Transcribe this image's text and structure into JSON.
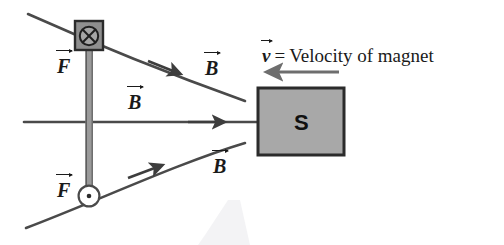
{
  "figure": {
    "background_color": "#ffffff",
    "line_color": "#4a4a4a",
    "dark_line_color": "#3a3a3a",
    "magnet": {
      "pole_label": "S",
      "fill_color": "#a8a8a8",
      "border_color": "#2b2b2b"
    },
    "velocity": {
      "symbol": "v",
      "equals": "=",
      "text": "Velocity of magnet",
      "full_label": "v = Velocity of magnet",
      "arrow_direction": "left",
      "arrow_color": "#6e6e6e"
    },
    "field_labels": [
      {
        "symbol": "B",
        "position": "upper-right-curve"
      },
      {
        "symbol": "B",
        "position": "middle-straight-line"
      },
      {
        "symbol": "B",
        "position": "lower-right-curve"
      }
    ],
    "force_labels": [
      {
        "symbol": "F",
        "position": "upper-rod"
      },
      {
        "symbol": "F",
        "position": "lower-rod"
      }
    ],
    "current_markers": [
      {
        "name": "into-page",
        "glyph": "cross-in-circle",
        "shape": "square",
        "fill_color": "#8f8f8f",
        "border_color": "#2b2b2b"
      },
      {
        "name": "out-of-page",
        "glyph": "dot-in-circle",
        "shape": "circle",
        "fill_color": "#ffffff",
        "border_color": "#4a4a4a"
      }
    ],
    "rod": {
      "fill_color": "#9a9a9a",
      "edge_color": "#5a5a5a"
    }
  }
}
